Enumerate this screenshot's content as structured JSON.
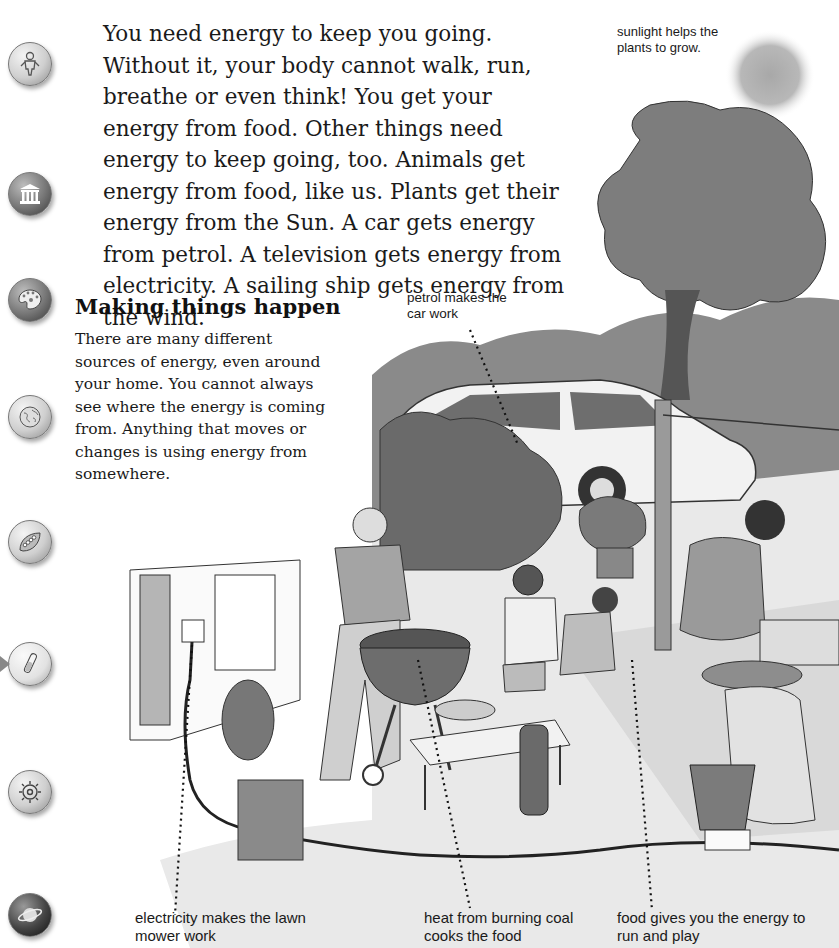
{
  "page": {
    "intro_text": "You need energy to keep you going. Without it, your body cannot walk, run, breathe or even think! You get your energy from food. Other things need energy to keep going, too. Animals get energy from food, like us. Plants get their energy from the Sun. A car gets energy from petrol. A television gets energy from electricity. A sailing ship gets energy from the wind.",
    "section": {
      "heading": "Making things happen",
      "body": "There are many different sources of energy, even around your home. You cannot always see where the energy is coming from. Anything that moves or changes is using energy from somewhere."
    }
  },
  "captions": {
    "sunlight": "sunlight helps the plants to grow.",
    "petrol": "petrol makes the car work",
    "electricity": "electricity makes the lawn mower work",
    "heat": "heat from burning coal cooks the food",
    "food": "food gives you the energy to run and play"
  },
  "side_icons": [
    {
      "name": "person-icon",
      "top": 42
    },
    {
      "name": "building-columns-icon",
      "top": 172
    },
    {
      "name": "paint-palette-icon",
      "top": 278
    },
    {
      "name": "globe-icon",
      "top": 395
    },
    {
      "name": "leaf-caterpillar-icon",
      "top": 520
    },
    {
      "name": "test-tube-icon",
      "top": 642
    },
    {
      "name": "gear-icon",
      "top": 770
    },
    {
      "name": "planet-icon",
      "top": 893
    }
  ],
  "colors": {
    "text": "#1a1a1a",
    "illustration_dark": "#555555",
    "illustration_mid": "#999999",
    "illustration_light": "#d6d6d6"
  }
}
